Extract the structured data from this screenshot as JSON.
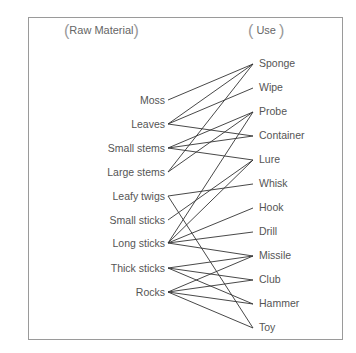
{
  "headers": {
    "left": "Raw Material",
    "right": "Use"
  },
  "materials": [
    {
      "label": "Moss",
      "y": 100
    },
    {
      "label": "Leaves",
      "y": 124
    },
    {
      "label": "Small stems",
      "y": 148
    },
    {
      "label": "Large stems",
      "y": 172
    },
    {
      "label": "Leafy twigs",
      "y": 196
    },
    {
      "label": "Small sticks",
      "y": 220
    },
    {
      "label": "Long sticks",
      "y": 243
    },
    {
      "label": "Thick sticks",
      "y": 268
    },
    {
      "label": "Rocks",
      "y": 292
    }
  ],
  "uses": [
    {
      "label": "Sponge",
      "y": 64
    },
    {
      "label": "Wipe",
      "y": 88
    },
    {
      "label": "Probe",
      "y": 112
    },
    {
      "label": "Container",
      "y": 136
    },
    {
      "label": "Lure",
      "y": 160
    },
    {
      "label": "Whisk",
      "y": 184
    },
    {
      "label": "Hook",
      "y": 208
    },
    {
      "label": "Drill",
      "y": 232
    },
    {
      "label": "Missile",
      "y": 256
    },
    {
      "label": "Club",
      "y": 280
    },
    {
      "label": "Hammer",
      "y": 304
    },
    {
      "label": "Toy",
      "y": 328
    }
  ],
  "connections": [
    [
      "Moss",
      "Sponge"
    ],
    [
      "Leaves",
      "Sponge"
    ],
    [
      "Leaves",
      "Wipe"
    ],
    [
      "Leaves",
      "Container"
    ],
    [
      "Small stems",
      "Probe"
    ],
    [
      "Small stems",
      "Container"
    ],
    [
      "Small stems",
      "Lure"
    ],
    [
      "Large stems",
      "Sponge"
    ],
    [
      "Large stems",
      "Probe"
    ],
    [
      "Leafy twigs",
      "Whisk"
    ],
    [
      "Leafy twigs",
      "Toy"
    ],
    [
      "Small sticks",
      "Lure"
    ],
    [
      "Long sticks",
      "Probe"
    ],
    [
      "Long sticks",
      "Lure"
    ],
    [
      "Long sticks",
      "Hook"
    ],
    [
      "Long sticks",
      "Drill"
    ],
    [
      "Long sticks",
      "Missile"
    ],
    [
      "Thick sticks",
      "Missile"
    ],
    [
      "Thick sticks",
      "Club"
    ],
    [
      "Thick sticks",
      "Hammer"
    ],
    [
      "Rocks",
      "Missile"
    ],
    [
      "Rocks",
      "Club"
    ],
    [
      "Rocks",
      "Hammer"
    ],
    [
      "Rocks",
      "Toy"
    ]
  ],
  "style": {
    "line_color": "#333333",
    "frame_color": "#9a9a9a",
    "text_color": "#555555"
  }
}
